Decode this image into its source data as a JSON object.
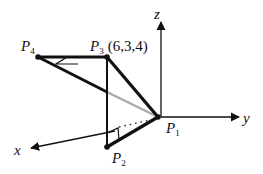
{
  "diagram": {
    "type": "3d-coordinate-diagram",
    "axes": {
      "x": {
        "label": "x"
      },
      "y": {
        "label": "y"
      },
      "z": {
        "label": "z"
      }
    },
    "points": [
      {
        "id": "P1",
        "name": "P",
        "sub": "1",
        "coords": ""
      },
      {
        "id": "P2",
        "name": "P",
        "sub": "2",
        "coords": ""
      },
      {
        "id": "P3",
        "name": "P",
        "sub": "3",
        "coords": "(6,3,4)"
      },
      {
        "id": "P4",
        "name": "P",
        "sub": "4",
        "coords": ""
      }
    ],
    "segments": [
      {
        "from": "P1",
        "to": "P2",
        "style": "thick"
      },
      {
        "from": "P2",
        "to": "P3",
        "style": "medium"
      },
      {
        "from": "P3",
        "to": "P1",
        "style": "thick"
      },
      {
        "from": "P3",
        "to": "P4",
        "style": "thick"
      },
      {
        "from": "P4",
        "to": "P1",
        "style": "thick-then-gray"
      },
      {
        "from": "P2-projection",
        "to": "P1",
        "style": "dotted"
      }
    ],
    "right_angle_markers": [
      "at P3 between P3P4 and P4P1 plane",
      "at P2 base"
    ],
    "colors": {
      "line": "#111111",
      "hidden": "#aaaaaa",
      "background": "#ffffff"
    }
  }
}
